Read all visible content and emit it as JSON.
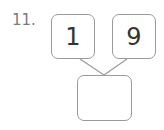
{
  "problem": {
    "number": "11.",
    "top_left_value": "1",
    "top_right_value": "9",
    "bottom_value": ""
  },
  "colors": {
    "border": "#9a9a9a",
    "number_text": "#7a7a7a",
    "digit_text": "#333333"
  }
}
